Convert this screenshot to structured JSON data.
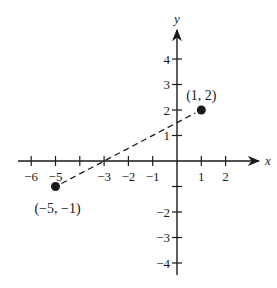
{
  "chart_data": {
    "type": "scatter",
    "title": "",
    "xlabel": "x",
    "ylabel": "y",
    "xlim": [
      -6.5,
      2.8
    ],
    "ylim": [
      -4.6,
      5.0
    ],
    "x_ticks": [
      -6,
      -5,
      -4,
      -3,
      -2,
      -1,
      1,
      2
    ],
    "x_tick_labels": [
      "−6",
      "−5",
      "",
      "−3",
      "−2",
      "−1",
      "1",
      "2"
    ],
    "y_ticks": [
      -4,
      -3,
      -2,
      -1,
      1,
      2,
      3,
      4
    ],
    "y_tick_labels": [
      "−4",
      "−3",
      "−2",
      "",
      "1",
      "2",
      "3",
      "4"
    ],
    "grid": false,
    "points": [
      {
        "x": -5,
        "y": -1,
        "label": "(−5, −1)"
      },
      {
        "x": 1,
        "y": 2,
        "label": "(1, 2)"
      }
    ],
    "segments": [
      {
        "from": [
          -5,
          -1
        ],
        "to": [
          1,
          2
        ],
        "style": "dashed"
      }
    ]
  },
  "colors": {
    "ink": "#1a1a1a",
    "background": "#ffffff"
  }
}
